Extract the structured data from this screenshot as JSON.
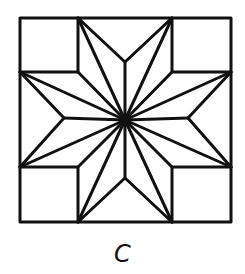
{
  "figure": {
    "label": "C",
    "stroke_color": "#111111",
    "background": "#ffffff"
  }
}
